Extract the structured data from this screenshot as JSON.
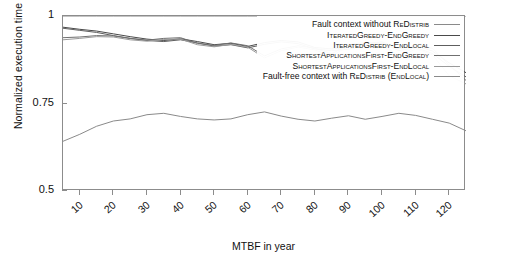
{
  "chart_data": {
    "type": "line",
    "title": "",
    "xlabel": "MTBF in year",
    "ylabel": "Normalized execution time",
    "xlim": [
      5,
      125
    ],
    "ylim": [
      0.5,
      1.0
    ],
    "yticks": [
      "0.5",
      "0.75",
      "1"
    ],
    "ytick_values": [
      0.5,
      0.75,
      1.0
    ],
    "xticks": [
      "10",
      "20",
      "30",
      "40",
      "50",
      "60",
      "70",
      "80",
      "90",
      "100",
      "110",
      "120"
    ],
    "xtick_values": [
      10,
      20,
      30,
      40,
      50,
      60,
      70,
      80,
      90,
      100,
      110,
      120
    ],
    "grid": false,
    "legend_position": "top-right inside axes",
    "x": [
      5,
      10,
      15,
      20,
      25,
      30,
      35,
      40,
      45,
      50,
      55,
      60,
      65,
      70,
      75,
      80,
      85,
      90,
      95,
      100,
      105,
      110,
      115,
      120,
      125
    ],
    "series": [
      {
        "name": "Fault context without ReDistrib",
        "color": "#8a8a8a",
        "width": 1.0,
        "values": [
          1.0,
          1.0,
          1.0,
          1.0,
          1.0,
          1.0,
          1.0,
          1.0,
          1.0,
          1.0,
          1.0,
          1.0,
          1.0,
          1.0,
          1.0,
          1.0,
          1.0,
          1.0,
          1.0,
          1.0,
          1.0,
          1.0,
          1.0,
          1.0,
          1.0
        ]
      },
      {
        "name": "IteratedGreedy-EndGreedy",
        "color": "#4a4a4a",
        "width": 1.0,
        "values": [
          0.968,
          0.962,
          0.957,
          0.949,
          0.941,
          0.934,
          0.93,
          0.935,
          0.927,
          0.918,
          0.922,
          0.913,
          0.924,
          0.93,
          0.926,
          0.91,
          0.906,
          0.91,
          0.921,
          0.926,
          0.906,
          0.915,
          0.9,
          0.866,
          0.838
        ]
      },
      {
        "name": "IteratedGreedy-EndLocal",
        "color": "#5e5e5e",
        "width": 1.0,
        "values": [
          0.965,
          0.959,
          0.953,
          0.944,
          0.936,
          0.93,
          0.927,
          0.932,
          0.923,
          0.914,
          0.918,
          0.909,
          0.919,
          0.926,
          0.921,
          0.906,
          0.901,
          0.905,
          0.916,
          0.922,
          0.901,
          0.91,
          0.893,
          0.856,
          0.826
        ]
      },
      {
        "name": "ShortestApplicationsFirst-EndGreedy",
        "color": "#707070",
        "width": 1.0,
        "values": [
          0.938,
          0.94,
          0.944,
          0.943,
          0.936,
          0.931,
          0.936,
          0.938,
          0.922,
          0.916,
          0.923,
          0.915,
          0.886,
          0.906,
          0.915,
          0.908,
          0.892,
          0.918,
          0.925,
          0.922,
          0.884,
          0.913,
          0.908,
          0.86,
          0.816
        ]
      },
      {
        "name": "ShortestApplicationsFirst-EndLocal",
        "color": "#9a9a9a",
        "width": 1.0,
        "values": [
          0.932,
          0.936,
          0.941,
          0.94,
          0.932,
          0.928,
          0.933,
          0.934,
          0.918,
          0.912,
          0.919,
          0.911,
          0.88,
          0.901,
          0.911,
          0.903,
          0.886,
          0.913,
          0.921,
          0.918,
          0.878,
          0.907,
          0.889,
          0.829,
          0.806
        ]
      },
      {
        "name": "Fault-free context with ReDistrib (EndLocal)",
        "color": "#8a8a8a",
        "width": 1.0,
        "values": [
          0.642,
          0.662,
          0.685,
          0.7,
          0.706,
          0.718,
          0.722,
          0.713,
          0.706,
          0.703,
          0.706,
          0.718,
          0.726,
          0.714,
          0.705,
          0.7,
          0.708,
          0.715,
          0.705,
          0.713,
          0.722,
          0.716,
          0.705,
          0.694,
          0.672
        ]
      }
    ]
  },
  "legend": {
    "items": [
      {
        "prefix": "Fault context without ",
        "smallcaps": "ReDistrib",
        "suffix": ""
      },
      {
        "prefix": "",
        "smallcaps": "IteratedGreedy-EndGreedy",
        "suffix": ""
      },
      {
        "prefix": "",
        "smallcaps": "IteratedGreedy-EndLocal",
        "suffix": ""
      },
      {
        "prefix": "",
        "smallcaps": "ShortestApplicationsFirst-EndGreedy",
        "suffix": ""
      },
      {
        "prefix": "",
        "smallcaps": "ShortestApplicationsFirst-EndLocal",
        "suffix": ""
      },
      {
        "prefix": "Fault-free context with ",
        "smallcaps": "ReDistrib (EndLocal)",
        "suffix": ""
      }
    ]
  }
}
